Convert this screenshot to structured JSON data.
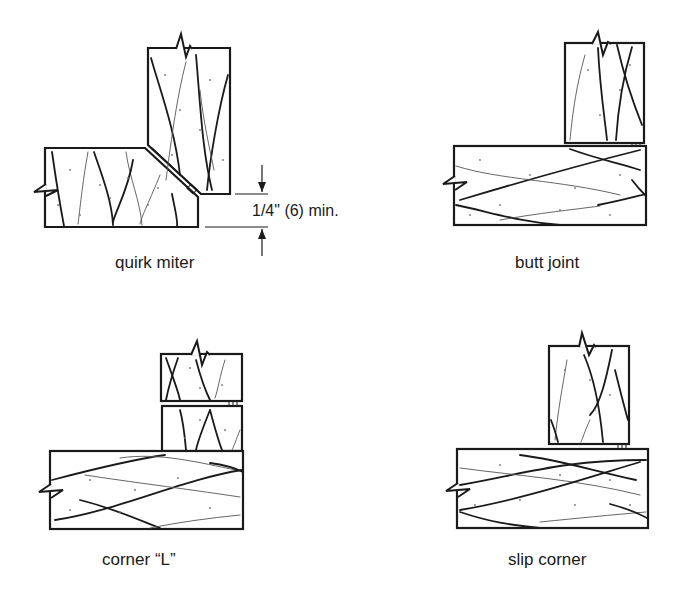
{
  "figure": {
    "panels": [
      {
        "id": "quirk-miter",
        "label": "quirk miter"
      },
      {
        "id": "butt-joint",
        "label": "butt joint"
      },
      {
        "id": "corner-l",
        "label": "corner “L”"
      },
      {
        "id": "slip-corner",
        "label": "slip corner"
      }
    ],
    "dimension": {
      "text_prefix": "1/4\"",
      "text_metric": "(6)",
      "text_suffix": "min."
    }
  },
  "colors": {
    "line": "#1a1a1a",
    "background": "#ffffff"
  }
}
